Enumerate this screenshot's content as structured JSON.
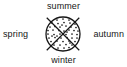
{
  "figure": {
    "labels": {
      "top": "summer",
      "bottom": "winter",
      "left": "spring",
      "right": "autumn"
    },
    "colors": {
      "ink": "#161616",
      "background": "#ffffff"
    },
    "geometry": {
      "center_x": 63,
      "center_y": 34,
      "circle_radius": 17,
      "cross_arm_extent": 23,
      "stroke_width": 1.2,
      "stipple_dot_radius": 0.85
    },
    "stipple_dots": [
      [
        57,
        20
      ],
      [
        63,
        19
      ],
      [
        69,
        20
      ],
      [
        52,
        23
      ],
      [
        58,
        23.5
      ],
      [
        64,
        22.5
      ],
      [
        70,
        23
      ],
      [
        75,
        24
      ],
      [
        50,
        27
      ],
      [
        55,
        26.5
      ],
      [
        60,
        27
      ],
      [
        66,
        26
      ],
      [
        71,
        27
      ],
      [
        76,
        27.5
      ],
      [
        48,
        30.5
      ],
      [
        53,
        30
      ],
      [
        59,
        30.5
      ],
      [
        64,
        31
      ],
      [
        69,
        30
      ],
      [
        74,
        30.5
      ],
      [
        78,
        31
      ],
      [
        48,
        34
      ],
      [
        54,
        34.5
      ],
      [
        60,
        34
      ],
      [
        66,
        34.5
      ],
      [
        72,
        34
      ],
      [
        77,
        34.5
      ],
      [
        49,
        38
      ],
      [
        55,
        37.5
      ],
      [
        61,
        38
      ],
      [
        67,
        37.5
      ],
      [
        72,
        38
      ],
      [
        77,
        38
      ],
      [
        51,
        41.5
      ],
      [
        57,
        41
      ],
      [
        63,
        41.5
      ],
      [
        69,
        41
      ],
      [
        75,
        41.5
      ],
      [
        54,
        45
      ],
      [
        60,
        45
      ],
      [
        66,
        44.5
      ],
      [
        72,
        45
      ],
      [
        58,
        48
      ],
      [
        64,
        48
      ],
      [
        69,
        47.5
      ],
      [
        62,
        25
      ],
      [
        67,
        32
      ],
      [
        57,
        36
      ],
      [
        70,
        43
      ],
      [
        52,
        36
      ]
    ]
  }
}
